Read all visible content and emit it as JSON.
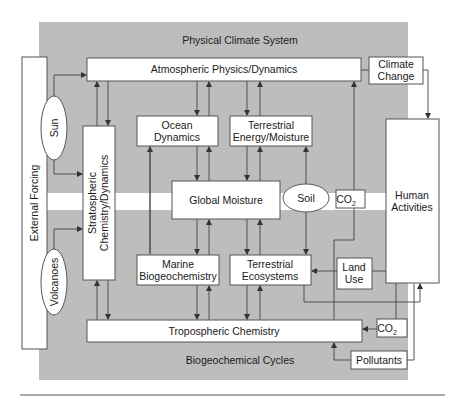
{
  "diagram": {
    "regions": {
      "top_label": "Physical Climate System",
      "bottom_label": "Biogeochemical Cycles"
    },
    "external": {
      "forcing": "External Forcing",
      "sun": "Sun",
      "volcanoes": "Volcanoes"
    },
    "nodes": {
      "atmos": "Atmospheric Physics/Dynamics",
      "strat_line1": "Stratospheric",
      "strat_line2": "Chemistry/Dynamics",
      "ocean_line1": "Ocean",
      "ocean_line2": "Dynamics",
      "terr_energy_line1": "Terrestrial",
      "terr_energy_line2": "Energy/Moisture",
      "global_moisture": "Global Moisture",
      "soil": "Soil",
      "co2_mid": "CO",
      "co2_sub": "2",
      "marine_line1": "Marine",
      "marine_line2": "Biogeochemistry",
      "terr_eco_line1": "Terrestrial",
      "terr_eco_line2": "Ecosystems",
      "land_use_line1": "Land",
      "land_use_line2": "Use",
      "trop": "Tropospheric Chemistry",
      "co2_bottom": "CO",
      "climate_change_line1": "Climate",
      "climate_change_line2": "Change",
      "human_line1": "Human",
      "human_line2": "Activities",
      "pollutants": "Pollutants"
    },
    "colors": {
      "background_gray": "#b9b9b9",
      "box_fill": "#ffffff",
      "line": "#444444"
    }
  }
}
